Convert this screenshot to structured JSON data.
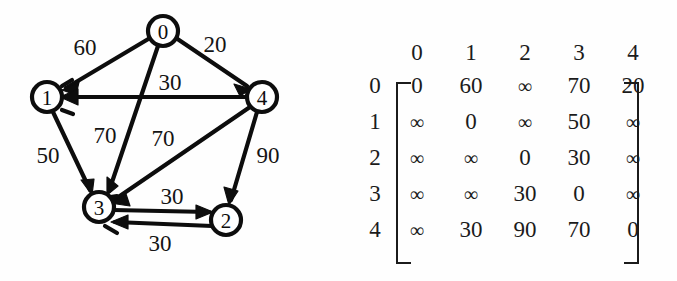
{
  "graph": {
    "title": "directed-weighted-graph",
    "nodes": [
      {
        "id": "0",
        "label": "0",
        "cx": 163,
        "cy": 31,
        "r": 15
      },
      {
        "id": "1",
        "label": "1",
        "cx": 47,
        "cy": 97,
        "r": 15
      },
      {
        "id": "2",
        "label": "2",
        "cx": 226,
        "cy": 220,
        "r": 15
      },
      {
        "id": "3",
        "label": "3",
        "cx": 99,
        "cy": 207,
        "r": 15
      },
      {
        "id": "4",
        "label": "4",
        "cx": 262,
        "cy": 97,
        "r": 15
      }
    ],
    "edges": [
      {
        "from": "0",
        "to": "1",
        "weight": "60",
        "label_x": 85,
        "label_y": 47
      },
      {
        "from": "0",
        "to": "4",
        "weight": "20",
        "label_x": 215,
        "label_y": 44
      },
      {
        "from": "0",
        "to": "3",
        "weight": "70",
        "label_x": 105,
        "label_y": 135
      },
      {
        "from": "4",
        "to": "1",
        "weight": "30",
        "label_x": 170,
        "label_y": 82
      },
      {
        "from": "4",
        "to": "3",
        "weight": "70",
        "label_x": 163,
        "label_y": 138
      },
      {
        "from": "4",
        "to": "2",
        "weight": "90",
        "label_x": 268,
        "label_y": 155
      },
      {
        "from": "1",
        "to": "3",
        "weight": "50",
        "label_x": 48,
        "label_y": 155
      },
      {
        "from": "3",
        "to": "2",
        "weight": "30",
        "label_x": 172,
        "label_y": 196
      },
      {
        "from": "2",
        "to": "3",
        "weight": "30",
        "label_x": 160,
        "label_y": 243
      }
    ]
  },
  "matrix": {
    "name": "adjacency-weight-matrix",
    "col_headers": [
      "0",
      "1",
      "2",
      "3",
      "4"
    ],
    "row_headers": [
      "0",
      "1",
      "2",
      "3",
      "4"
    ],
    "infinity_symbol": "∞",
    "rows": [
      [
        "0",
        "60",
        "∞",
        "70",
        "20"
      ],
      [
        "∞",
        "0",
        "∞",
        "50",
        "∞"
      ],
      [
        "∞",
        "∞",
        "0",
        "30",
        "∞"
      ],
      [
        "∞",
        "∞",
        "30",
        "0",
        "∞"
      ],
      [
        "∞",
        "30",
        "90",
        "70",
        "0"
      ]
    ]
  },
  "colors": {
    "ink": "#0d0d0d",
    "paper": "#fefefe"
  }
}
